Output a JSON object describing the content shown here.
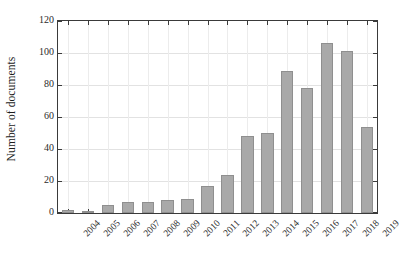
{
  "chart_data": {
    "type": "bar",
    "title": "",
    "subtitle": "",
    "xlabel": "",
    "ylabel": "Number of documents",
    "categories": [
      "2004",
      "2005",
      "2006",
      "2007",
      "2008",
      "2009",
      "2010",
      "2011",
      "2012",
      "2013",
      "2014",
      "2015",
      "2016",
      "2017",
      "2018",
      "2019"
    ],
    "values": [
      2,
      1,
      5,
      7,
      7,
      8,
      9,
      17,
      24,
      48,
      50,
      89,
      78,
      106,
      101,
      54
    ],
    "ylim": [
      0,
      120
    ],
    "yticks": [
      0,
      20,
      40,
      60,
      80,
      100,
      120
    ],
    "ytick_labels": [
      "0",
      "20",
      "40",
      "60",
      "80",
      "100",
      "120"
    ],
    "grid": true,
    "legend": null,
    "legend_position": "none",
    "bar_color": "#a9a9a9",
    "bar_edge_color": "#8f8f8f",
    "axis_color": "#3a3a3a",
    "grid_color": "#e2e2e2",
    "background": "#ffffff",
    "xtick_rotation": -45
  }
}
